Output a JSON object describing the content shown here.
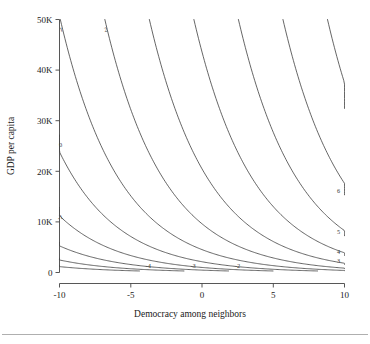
{
  "chart_data": {
    "type": "line",
    "subtype": "contour",
    "title": "",
    "xlabel": "Democracy among neighbors",
    "ylabel": "GDP per capita",
    "xlim": [
      -10,
      10
    ],
    "ylim": [
      0,
      50000
    ],
    "xticks": [
      -10,
      -5,
      0,
      5,
      10
    ],
    "xticklabels": [
      "-10",
      "-5",
      "0",
      "5",
      "10"
    ],
    "yticks": [
      0,
      10000,
      20000,
      30000,
      40000,
      50000
    ],
    "yticklabels": [
      "0",
      "10K",
      "20K",
      "30K",
      "40K",
      "50K"
    ],
    "grid": false,
    "legend": false,
    "contour_levels": [
      -4,
      -3,
      -2,
      -1,
      0,
      1,
      2,
      3,
      4,
      5,
      6,
      7,
      8,
      9,
      10
    ],
    "contour_labels": [
      "-4",
      "-3",
      "-2",
      "-1",
      "0",
      "1",
      "2",
      "3",
      "4",
      "5",
      "6",
      "7",
      "8",
      "9",
      "10"
    ],
    "model": {
      "description": "Predicted level surface rising with democracy among neighbors and with GDP per capita",
      "form": "z = a*x + b*log10(gdp) + c",
      "a": 0.32,
      "b": 3.05,
      "c": -10.15,
      "gdp_floor": 300
    },
    "labelled_contours": {
      "top_edge": [
        "-1",
        "0",
        "1",
        "2"
      ],
      "left_edge": [
        "-4",
        "-3",
        "-2"
      ],
      "bottom_edge": [
        "3",
        "4",
        "5",
        "6"
      ],
      "right_edge": [
        "8",
        "9",
        "10"
      ]
    }
  },
  "axes": {
    "x_title": "Democracy among neighbors",
    "y_title": "GDP per capita"
  }
}
